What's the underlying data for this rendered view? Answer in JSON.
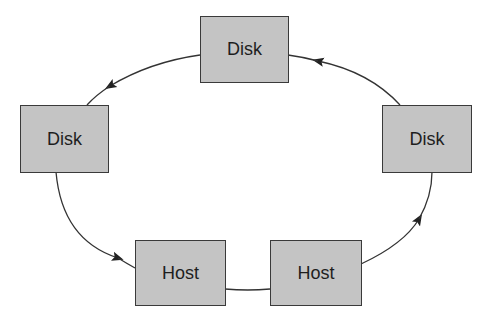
{
  "diagram": {
    "type": "ring-topology",
    "colors": {
      "node_fill": "#c4c4c4",
      "node_border": "#3a3a3a",
      "edge": "#333333",
      "text": "#1e1e1e"
    },
    "nodes": [
      {
        "id": "disk_top",
        "label": "Disk"
      },
      {
        "id": "disk_left",
        "label": "Disk"
      },
      {
        "id": "disk_right",
        "label": "Disk"
      },
      {
        "id": "host_left",
        "label": "Host"
      },
      {
        "id": "host_right",
        "label": "Host"
      }
    ],
    "edges": [
      {
        "from": "disk_top",
        "to": "disk_left",
        "arrow": true
      },
      {
        "from": "disk_left",
        "to": "host_left",
        "arrow": true
      },
      {
        "from": "host_left",
        "to": "host_right",
        "arrow": false
      },
      {
        "from": "host_right",
        "to": "disk_right",
        "arrow": true
      },
      {
        "from": "disk_right",
        "to": "disk_top",
        "arrow": true
      }
    ]
  }
}
